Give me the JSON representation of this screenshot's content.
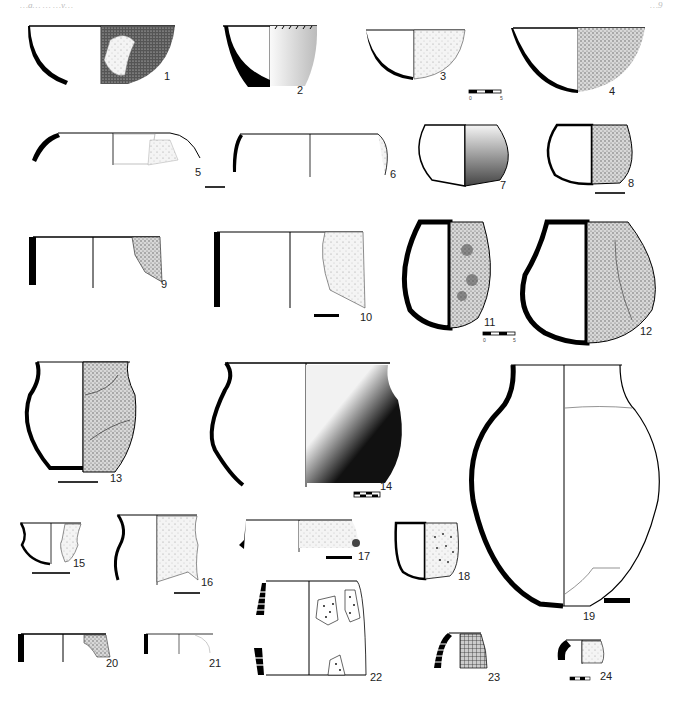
{
  "plate": {
    "header_left": "…g… … …y…",
    "header_right": "…9",
    "figures": [
      {
        "n": "1",
        "label": "1",
        "type": "bowl",
        "surface": "dark stippled, patched"
      },
      {
        "n": "2",
        "label": "2",
        "type": "conical bowl",
        "surface": "light stipple, incised rim"
      },
      {
        "n": "3",
        "label": "3",
        "type": "hemispherical bowl",
        "surface": "light stipple"
      },
      {
        "n": "4",
        "label": "4",
        "type": "hemispherical bowl",
        "surface": "dense stipple"
      },
      {
        "n": "5",
        "label": "5",
        "type": "wide shallow dish",
        "surface": "sherd outline"
      },
      {
        "n": "6",
        "label": "6",
        "type": "wide shallow dish",
        "surface": "light stipple"
      },
      {
        "n": "7",
        "label": "7",
        "type": "closed bowl",
        "surface": "graded stipple"
      },
      {
        "n": "8",
        "label": "8",
        "type": "deep bowl",
        "surface": "dense stipple"
      },
      {
        "n": "9",
        "label": "9",
        "type": "straight-walled vessel",
        "surface": "fragment"
      },
      {
        "n": "10",
        "label": "10",
        "type": "straight-walled vessel",
        "surface": "fragment"
      },
      {
        "n": "11",
        "label": "11",
        "type": "globular pot",
        "surface": "stipple with knobs"
      },
      {
        "n": "12",
        "label": "12",
        "type": "globular pot",
        "surface": "stipple with lugs"
      },
      {
        "n": "13",
        "label": "13",
        "type": "necked jar",
        "surface": "stippled, cracked"
      },
      {
        "n": "14",
        "label": "14",
        "type": "necked jar",
        "surface": "graded dark stipple"
      },
      {
        "n": "15",
        "label": "15",
        "type": "carinated cup",
        "surface": "fragment"
      },
      {
        "n": "16",
        "label": "16",
        "type": "S-profile vessel",
        "surface": "stipple"
      },
      {
        "n": "17",
        "label": "17",
        "type": "dish with lug",
        "surface": "light stipple"
      },
      {
        "n": "18",
        "label": "18",
        "type": "cup",
        "surface": "impressed dots"
      },
      {
        "n": "19",
        "label": "19",
        "type": "large ovoid jar",
        "surface": "outline"
      },
      {
        "n": "20",
        "label": "20",
        "type": "rim fragment",
        "surface": "dotted"
      },
      {
        "n": "21",
        "label": "21",
        "type": "rim fragment",
        "surface": "outline"
      },
      {
        "n": "22",
        "label": "22",
        "type": "cylindrical vessel",
        "surface": "dotted sherds"
      },
      {
        "n": "23",
        "label": "23",
        "type": "rim fragment",
        "surface": "grid incised"
      },
      {
        "n": "24",
        "label": "24",
        "type": "rim fragment",
        "surface": "stipple dots"
      }
    ],
    "scale_bars": [
      {
        "near": "3",
        "start": "0",
        "end": "5"
      },
      {
        "near": "11",
        "start": "0",
        "end": "5"
      }
    ]
  }
}
